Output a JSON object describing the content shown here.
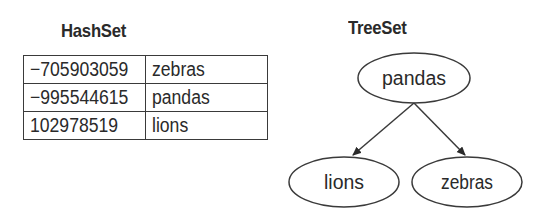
{
  "hashset": {
    "title": "HashSet",
    "rows": [
      {
        "hash": "−705903059",
        "value": "zebras"
      },
      {
        "hash": "−995544615",
        "value": "pandas"
      },
      {
        "hash": "102978519",
        "value": "lions"
      }
    ]
  },
  "treeset": {
    "title": "TreeSet",
    "root": "pandas",
    "left": "lions",
    "right": "zebras"
  }
}
